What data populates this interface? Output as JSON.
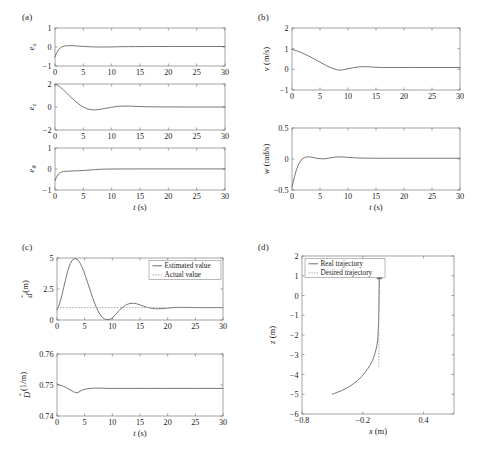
{
  "figure": {
    "panel_tags": [
      "(a)",
      "(b)",
      "(c)",
      "(d)"
    ]
  },
  "chart_data": [
    {
      "id": "a1",
      "panel": "(a)",
      "type": "line",
      "title": "",
      "xlabel": "t (s)",
      "ylabel": "e_x",
      "ylabel_base": "e",
      "ylabel_sub": "x",
      "xlim": [
        0,
        30
      ],
      "ylim": [
        -1,
        1
      ],
      "xticks": [
        0,
        5,
        10,
        15,
        20,
        25,
        30
      ],
      "xticklabels": [
        "0",
        "5",
        "10",
        "15",
        "20",
        "25",
        "30"
      ],
      "yticks": [
        -1,
        0,
        1
      ],
      "yticklabels": [
        "-1",
        "0",
        "1"
      ],
      "grid": false,
      "legend": null,
      "series": [
        {
          "name": "e_x",
          "style": "solid",
          "color": "#5e5e5e",
          "x": [
            0,
            0.3,
            0.6,
            0.9,
            1.3,
            1.8,
            2.4,
            3,
            4,
            5,
            6,
            7,
            8,
            9,
            10,
            11,
            12,
            13,
            14,
            16,
            18,
            20,
            24,
            30
          ],
          "y": [
            -0.52,
            -0.3,
            -0.15,
            -0.05,
            0.02,
            0.06,
            0.07,
            0.07,
            0.05,
            0.03,
            0.015,
            0.005,
            0.0,
            0.0,
            0.005,
            0.012,
            0.018,
            0.02,
            0.022,
            0.023,
            0.024,
            0.024,
            0.025,
            0.025
          ]
        }
      ]
    },
    {
      "id": "a2",
      "panel": "(a)",
      "type": "line",
      "title": "",
      "xlabel": "t (s)",
      "ylabel": "e_z",
      "ylabel_base": "e",
      "ylabel_sub": "z",
      "xlim": [
        0,
        30
      ],
      "ylim": [
        -2,
        2
      ],
      "xticks": [
        0,
        5,
        10,
        15,
        20,
        25,
        30
      ],
      "xticklabels": [
        "0",
        "5",
        "10",
        "15",
        "20",
        "25",
        "30"
      ],
      "yticks": [
        -2,
        0,
        2
      ],
      "yticklabels": [
        "-2",
        "0",
        "2"
      ],
      "grid": false,
      "legend": null,
      "series": [
        {
          "name": "e_z",
          "style": "solid",
          "color": "#5e5e5e",
          "x": [
            0,
            0.5,
            1,
            1.5,
            2,
            2.5,
            3,
            3.5,
            4,
            4.5,
            5,
            5.5,
            6,
            6.5,
            7,
            7.5,
            8,
            9,
            10,
            11,
            12,
            13,
            14,
            15,
            16,
            18,
            20,
            24,
            30
          ],
          "y": [
            2.0,
            1.88,
            1.7,
            1.48,
            1.24,
            1.0,
            0.76,
            0.54,
            0.33,
            0.15,
            0.0,
            -0.12,
            -0.2,
            -0.24,
            -0.25,
            -0.23,
            -0.2,
            -0.11,
            -0.02,
            0.05,
            0.08,
            0.08,
            0.06,
            0.04,
            0.025,
            0.01,
            0.005,
            0.0,
            0.0
          ]
        }
      ]
    },
    {
      "id": "a3",
      "panel": "(a)",
      "type": "line",
      "title": "",
      "xlabel": "t (s)",
      "ylabel": "e_theta",
      "ylabel_base": "e",
      "ylabel_sub": "θ",
      "xlim": [
        0,
        30
      ],
      "ylim": [
        -1,
        1
      ],
      "xticks": [
        0,
        5,
        10,
        15,
        20,
        25,
        30
      ],
      "xticklabels": [
        "0",
        "5",
        "10",
        "15",
        "20",
        "25",
        "30"
      ],
      "yticks": [
        -1,
        0,
        1
      ],
      "yticklabels": [
        "-1",
        "0",
        "1"
      ],
      "grid": false,
      "legend": null,
      "series": [
        {
          "name": "e_theta",
          "style": "solid",
          "color": "#5e5e5e",
          "x": [
            0,
            0.3,
            0.6,
            1,
            1.5,
            2,
            2.5,
            3,
            4,
            5,
            6,
            7,
            8,
            9,
            10,
            12,
            14,
            16,
            20,
            25,
            30
          ],
          "y": [
            -0.56,
            -0.36,
            -0.24,
            -0.16,
            -0.12,
            -0.105,
            -0.1,
            -0.095,
            -0.085,
            -0.07,
            -0.05,
            -0.03,
            -0.014,
            -0.005,
            0.0,
            0.003,
            0.004,
            0.004,
            0.004,
            0.004,
            0.004
          ]
        }
      ]
    },
    {
      "id": "b1",
      "panel": "(b)",
      "type": "line",
      "title": "",
      "xlabel": "t (s)",
      "ylabel": "v (m/s)",
      "ylabel_base": "v",
      "ylabel_unit": "(m/s)",
      "xlim": [
        0,
        30
      ],
      "ylim": [
        -1,
        2
      ],
      "xticks": [
        0,
        5,
        10,
        15,
        20,
        25,
        30
      ],
      "xticklabels": [
        "0",
        "5",
        "10",
        "15",
        "20",
        "25",
        "30"
      ],
      "yticks": [
        -1,
        0,
        1,
        2
      ],
      "yticklabels": [
        "-1",
        "0",
        "1",
        "2"
      ],
      "grid": false,
      "legend": null,
      "series": [
        {
          "name": "v",
          "style": "solid",
          "color": "#5e5e5e",
          "x": [
            0,
            1,
            2,
            3,
            4,
            5,
            6,
            7,
            8,
            8.5,
            9,
            10,
            11,
            12,
            13,
            14,
            15,
            16,
            17,
            18,
            20,
            22,
            25,
            30
          ],
          "y": [
            0.97,
            0.88,
            0.77,
            0.64,
            0.5,
            0.35,
            0.2,
            0.07,
            -0.02,
            -0.04,
            -0.03,
            0.03,
            0.08,
            0.12,
            0.13,
            0.12,
            0.1,
            0.09,
            0.085,
            0.085,
            0.09,
            0.09,
            0.09,
            0.09
          ]
        }
      ]
    },
    {
      "id": "b2",
      "panel": "(b)",
      "type": "line",
      "title": "",
      "xlabel": "t (s)",
      "ylabel": "w (rad/s)",
      "ylabel_base": "w",
      "ylabel_unit": "(rad/s)",
      "xlim": [
        0,
        30
      ],
      "ylim": [
        -0.5,
        0.5
      ],
      "xticks": [
        0,
        5,
        10,
        15,
        20,
        25,
        30
      ],
      "xticklabels": [
        "0",
        "5",
        "10",
        "15",
        "20",
        "25",
        "30"
      ],
      "yticks": [
        -0.5,
        0,
        0.5
      ],
      "yticklabels": [
        "-0.5",
        "0",
        "0.5"
      ],
      "grid": false,
      "legend": null,
      "series": [
        {
          "name": "w",
          "style": "solid",
          "color": "#5e5e5e",
          "x": [
            0,
            0.4,
            0.8,
            1.2,
            1.8,
            2.4,
            3,
            3.5,
            4,
            4.5,
            5,
            5.5,
            6,
            6.5,
            7,
            7.5,
            8,
            8.5,
            9,
            9.5,
            10,
            11,
            12,
            14,
            16,
            20,
            25,
            30
          ],
          "y": [
            -0.45,
            -0.3,
            -0.17,
            -0.08,
            0.0,
            0.03,
            0.035,
            0.03,
            0.02,
            0.01,
            0.005,
            0.003,
            0.005,
            0.012,
            0.02,
            0.028,
            0.032,
            0.034,
            0.033,
            0.03,
            0.026,
            0.02,
            0.016,
            0.013,
            0.012,
            0.012,
            0.012,
            0.012
          ]
        }
      ]
    },
    {
      "id": "c1",
      "panel": "(c)",
      "type": "line",
      "title": "",
      "xlabel": "t (s)",
      "ylabel": "d-hat (m)",
      "ylabel_base": "d",
      "ylabel_unit": "(m)",
      "xlim": [
        0,
        30
      ],
      "ylim": [
        0,
        5
      ],
      "xticks": [
        0,
        5,
        10,
        15,
        20,
        25,
        30
      ],
      "xticklabels": [
        "0",
        "5",
        "10",
        "15",
        "20",
        "25",
        "30"
      ],
      "yticks": [
        0,
        2.5,
        5
      ],
      "yticklabels": [
        "0",
        "2.5",
        "5"
      ],
      "grid": false,
      "legend": {
        "position": "upper-right",
        "entries": [
          "Estimated value",
          "Actual value"
        ]
      },
      "series": [
        {
          "name": "Estimated value",
          "style": "solid",
          "color": "#5e5e5e",
          "x": [
            0,
            0.4,
            0.8,
            1.2,
            1.6,
            2,
            2.4,
            2.8,
            3.2,
            3.6,
            4,
            4.4,
            4.8,
            5.2,
            5.6,
            6,
            6.5,
            7,
            7.5,
            8,
            8.5,
            9,
            9.4,
            9.8,
            10.2,
            10.8,
            11.4,
            12,
            12.6,
            13.2,
            13.8,
            14.4,
            15,
            15.6,
            16.2,
            17,
            18,
            19,
            20,
            21,
            22,
            24,
            26,
            30
          ],
          "y": [
            0.82,
            1.2,
            1.85,
            2.6,
            3.35,
            4.05,
            4.55,
            4.85,
            4.95,
            4.92,
            4.72,
            4.4,
            3.97,
            3.47,
            2.93,
            2.38,
            1.72,
            1.12,
            0.65,
            0.3,
            0.1,
            0.03,
            0.03,
            0.1,
            0.25,
            0.55,
            0.85,
            1.08,
            1.25,
            1.33,
            1.35,
            1.31,
            1.22,
            1.12,
            1.03,
            0.95,
            0.9,
            0.92,
            0.96,
            1.0,
            1.02,
            1.01,
            1.0,
            1.0
          ]
        },
        {
          "name": "Actual value",
          "style": "dotted",
          "color": "#9a9a9a",
          "x": [
            0,
            30
          ],
          "y": [
            1.0,
            1.0
          ]
        }
      ]
    },
    {
      "id": "c2",
      "panel": "(c)",
      "type": "line",
      "title": "",
      "xlabel": "t (s)",
      "ylabel": "D-hat (1/m)",
      "ylabel_base": "D",
      "ylabel_unit": "(1/m)",
      "xlim": [
        0,
        30
      ],
      "ylim": [
        0.74,
        0.76
      ],
      "xticks": [
        0,
        5,
        10,
        15,
        20,
        25,
        30
      ],
      "xticklabels": [
        "0",
        "5",
        "10",
        "15",
        "20",
        "25",
        "30"
      ],
      "yticks": [
        0.74,
        0.75,
        0.76
      ],
      "yticklabels": [
        "0.74",
        "0.75",
        "0.76"
      ],
      "grid": false,
      "legend": null,
      "series": [
        {
          "name": "D-hat",
          "style": "solid",
          "color": "#5e5e5e",
          "x": [
            0,
            0.5,
            1,
            1.5,
            2,
            2.5,
            3,
            3.4,
            3.8,
            4.2,
            4.6,
            5,
            5.5,
            6,
            6.5,
            7,
            8,
            9,
            10,
            12,
            14,
            16,
            20,
            25,
            30
          ],
          "y": [
            0.7503,
            0.75,
            0.7497,
            0.7493,
            0.7488,
            0.7483,
            0.7478,
            0.7475,
            0.7476,
            0.748,
            0.7484,
            0.7486,
            0.7488,
            0.7489,
            0.74895,
            0.749,
            0.749,
            0.7489,
            0.7489,
            0.7489,
            0.7489,
            0.7489,
            0.7489,
            0.7489,
            0.7489
          ]
        }
      ]
    },
    {
      "id": "d1",
      "panel": "(d)",
      "type": "line",
      "title": "",
      "xlabel": "x (m)",
      "ylabel": "z (m)",
      "ylabel_base": "z",
      "ylabel_unit": "(m)",
      "xlim": [
        -0.8,
        0.7
      ],
      "ylim": [
        -6,
        2
      ],
      "xticks": [
        -0.8,
        -0.2,
        0.4
      ],
      "xticklabels": [
        "-0.8",
        "-0.2",
        "0.4"
      ],
      "yticks": [
        -6,
        -5,
        -4,
        -3,
        -2,
        -1,
        0,
        1,
        2
      ],
      "yticklabels": [
        "-6",
        "-5",
        "-4",
        "-3",
        "-2",
        "-1",
        "0",
        "1",
        "2"
      ],
      "grid": false,
      "legend": {
        "position": "upper-left",
        "entries": [
          "Real trajectory",
          "Desired trajectory"
        ]
      },
      "series": [
        {
          "name": "Real trajectory",
          "style": "solid",
          "color": "#5e5e5e",
          "x": [
            -0.5,
            -0.48,
            -0.45,
            -0.41,
            -0.37,
            -0.33,
            -0.29,
            -0.25,
            -0.21,
            -0.18,
            -0.15,
            -0.125,
            -0.105,
            -0.09,
            -0.078,
            -0.068,
            -0.06,
            -0.054,
            -0.05,
            -0.047,
            -0.044,
            -0.042,
            -0.04,
            -0.039,
            -0.038,
            -0.037,
            -0.036,
            -0.036,
            -0.035
          ],
          "y": [
            -5.0,
            -4.96,
            -4.9,
            -4.82,
            -4.72,
            -4.6,
            -4.46,
            -4.3,
            -4.1,
            -3.9,
            -3.7,
            -3.5,
            -3.3,
            -3.1,
            -2.9,
            -2.7,
            -2.5,
            -2.3,
            -2.05,
            -1.7,
            -1.3,
            -0.85,
            -0.4,
            0.0,
            0.35,
            0.62,
            0.85,
            1.0,
            1.1
          ]
        },
        {
          "name": "Desired trajectory",
          "style": "dotted",
          "color": "#9a9a9a",
          "x": [
            -0.042,
            -0.042,
            -0.042,
            -0.042,
            -0.042,
            -0.042,
            -0.042
          ],
          "y": [
            -3.6,
            -3.0,
            -2.4,
            -1.8,
            -1.0,
            0.0,
            1.1
          ]
        }
      ],
      "arrow": {
        "x": -0.035,
        "y": 1.1,
        "direction": "up"
      }
    }
  ]
}
